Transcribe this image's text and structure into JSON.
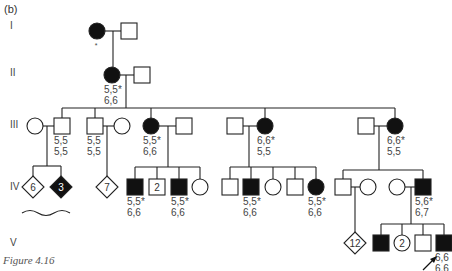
{
  "panel_label": "(b)",
  "caption": "Figure 4.16",
  "generations": [
    {
      "label": "I",
      "y": 25
    },
    {
      "label": "II",
      "y": 72
    },
    {
      "label": "III",
      "y": 124
    },
    {
      "label": "IV",
      "y": 186
    },
    {
      "label": "V",
      "y": 242
    }
  ],
  "colors": {
    "affected": "#111111",
    "unaffected": "#ffffff",
    "stroke": "#222222"
  },
  "individuals": [
    {
      "id": "I-1",
      "sex": "F",
      "affected": true,
      "x": 97,
      "y": 31,
      "note": "*"
    },
    {
      "id": "I-2",
      "sex": "M",
      "affected": false,
      "x": 129,
      "y": 31
    },
    {
      "id": "II-1",
      "sex": "F",
      "affected": true,
      "x": 112,
      "y": 75,
      "genotype": [
        "5,5*",
        "6,6"
      ]
    },
    {
      "id": "II-2",
      "sex": "M",
      "affected": false,
      "x": 142,
      "y": 75
    },
    {
      "id": "III-1",
      "sex": "F",
      "affected": false,
      "x": 35,
      "y": 126
    },
    {
      "id": "III-2",
      "sex": "M",
      "affected": false,
      "x": 62,
      "y": 126,
      "genotype": [
        "5,5",
        "5,5"
      ]
    },
    {
      "id": "III-3",
      "sex": "M",
      "affected": false,
      "x": 95,
      "y": 126,
      "genotype": [
        "5,5",
        "5,5"
      ]
    },
    {
      "id": "III-4",
      "sex": "F",
      "affected": false,
      "x": 122,
      "y": 126
    },
    {
      "id": "III-5",
      "sex": "F",
      "affected": true,
      "x": 151,
      "y": 126,
      "genotype": [
        "5,5*",
        "6,6"
      ]
    },
    {
      "id": "III-6",
      "sex": "M",
      "affected": false,
      "x": 184,
      "y": 126
    },
    {
      "id": "III-7",
      "sex": "M",
      "affected": false,
      "x": 235,
      "y": 126
    },
    {
      "id": "III-8",
      "sex": "F",
      "affected": true,
      "x": 265,
      "y": 126,
      "genotype": [
        "6,6*",
        "5,5"
      ]
    },
    {
      "id": "III-9",
      "sex": "M",
      "affected": false,
      "x": 366,
      "y": 126
    },
    {
      "id": "III-10",
      "sex": "F",
      "affected": true,
      "x": 395,
      "y": 126,
      "genotype": [
        "6,6*",
        "5,5"
      ]
    },
    {
      "id": "IV-1",
      "sex": "U",
      "affected": false,
      "x": 33,
      "y": 187,
      "count": "6"
    },
    {
      "id": "IV-2",
      "sex": "U",
      "affected": true,
      "x": 61,
      "y": 187,
      "count": "3"
    },
    {
      "id": "IV-3",
      "sex": "U",
      "affected": false,
      "x": 107,
      "y": 187,
      "count": "7"
    },
    {
      "id": "IV-4",
      "sex": "M",
      "affected": true,
      "x": 135,
      "y": 187,
      "genotype": [
        "5,5*",
        "6,6"
      ]
    },
    {
      "id": "IV-5",
      "sex": "M",
      "affected": false,
      "x": 157,
      "y": 187,
      "count": "2"
    },
    {
      "id": "IV-6",
      "sex": "M",
      "affected": true,
      "x": 179,
      "y": 187,
      "genotype": [
        "5,5*",
        "6,6"
      ]
    },
    {
      "id": "IV-7",
      "sex": "F",
      "affected": false,
      "x": 200,
      "y": 187
    },
    {
      "id": "IV-8",
      "sex": "M",
      "affected": false,
      "x": 230,
      "y": 187
    },
    {
      "id": "IV-9",
      "sex": "M",
      "affected": true,
      "x": 251,
      "y": 187,
      "genotype": [
        "5,5*",
        "6,6"
      ]
    },
    {
      "id": "IV-10",
      "sex": "F",
      "affected": false,
      "x": 273,
      "y": 187
    },
    {
      "id": "IV-11",
      "sex": "M",
      "affected": false,
      "x": 295,
      "y": 187
    },
    {
      "id": "IV-12",
      "sex": "F",
      "affected": true,
      "x": 316,
      "y": 187,
      "genotype": [
        "5,5*",
        "6,6"
      ]
    },
    {
      "id": "IV-13",
      "sex": "M",
      "affected": false,
      "x": 343,
      "y": 187
    },
    {
      "id": "IV-14",
      "sex": "F",
      "affected": false,
      "x": 368,
      "y": 187
    },
    {
      "id": "IV-15",
      "sex": "F",
      "affected": false,
      "x": 397,
      "y": 187
    },
    {
      "id": "IV-16",
      "sex": "M",
      "affected": true,
      "x": 423,
      "y": 187,
      "genotype": [
        "5,6*",
        "6,7"
      ]
    },
    {
      "id": "V-1",
      "sex": "U",
      "affected": false,
      "x": 355,
      "y": 243,
      "count": "12"
    },
    {
      "id": "V-2",
      "sex": "M",
      "affected": true,
      "x": 381,
      "y": 243
    },
    {
      "id": "V-3",
      "sex": "F",
      "affected": false,
      "x": 402,
      "y": 243,
      "count": "2"
    },
    {
      "id": "V-4",
      "sex": "M",
      "affected": false,
      "x": 423,
      "y": 243
    },
    {
      "id": "V-5",
      "sex": "M",
      "affected": true,
      "x": 444,
      "y": 243,
      "genotype": [
        "6,6",
        "6,6"
      ],
      "proband": true
    }
  ]
}
